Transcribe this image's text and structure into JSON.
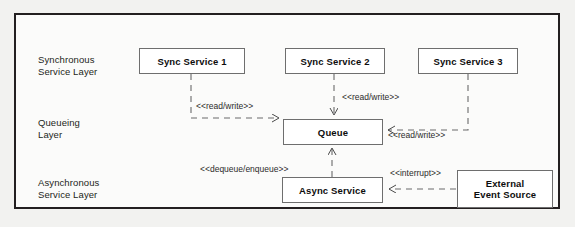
{
  "diagram": {
    "frame": {
      "border_color": "#231f20",
      "background": "#fbfbfa"
    },
    "page_background": "#f2f2f0"
  },
  "layers": [
    {
      "id": "sync",
      "label": "Synchronous\nService Layer"
    },
    {
      "id": "queue",
      "label": "Queueing\nLayer"
    },
    {
      "id": "async",
      "label": "Asynchronous\nService Layer"
    }
  ],
  "nodes": [
    {
      "id": "sync1",
      "label": "Sync Service 1"
    },
    {
      "id": "sync2",
      "label": "Sync Service 2"
    },
    {
      "id": "sync3",
      "label": "Sync Service 3"
    },
    {
      "id": "queue",
      "label": "Queue"
    },
    {
      "id": "async",
      "label": "Async Service"
    },
    {
      "id": "external",
      "label": "External\nEvent Source"
    }
  ],
  "connector_labels": [
    {
      "id": "sync1-queue",
      "text": "<<read/write>>"
    },
    {
      "id": "sync2-queue",
      "text": "<<read/write>>"
    },
    {
      "id": "sync3-queue",
      "text": "<<read/write>>"
    },
    {
      "id": "async-queue",
      "text": "<<dequeue/enqueue>>"
    },
    {
      "id": "external-async",
      "text": "<<interrupt>>"
    }
  ]
}
